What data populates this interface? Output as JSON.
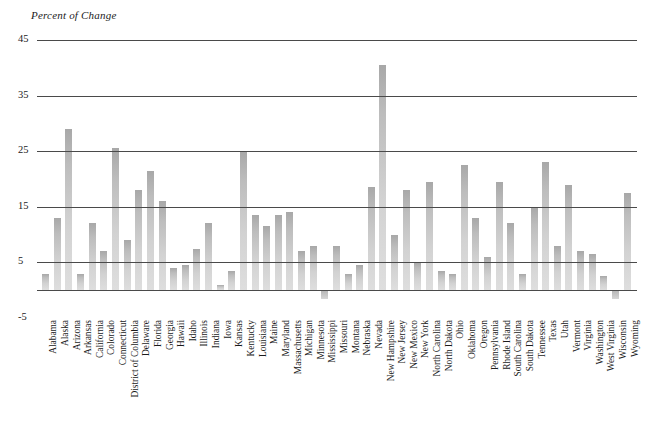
{
  "chart_data": {
    "type": "bar",
    "title": "Percent of Change",
    "xlabel": "",
    "ylabel": "Percent of Change",
    "ylim": [
      -5,
      45
    ],
    "yticks": [
      45,
      35,
      25,
      15,
      5,
      -5
    ],
    "grid": true,
    "zero_line": true,
    "legend": "none",
    "bar_color": "#c4c4c4",
    "axis_color": "#4a4a4a",
    "categories": [
      "Alabama",
      "Alaska",
      "Arizona",
      "Arkansas",
      "California",
      "Colorado",
      "Connecticut",
      "District of Columbia",
      "Delaware",
      "Florida",
      "Georgia",
      "Hawaii",
      "Idaho",
      "Illinois",
      "Indiana",
      "Iowa",
      "Kansas",
      "Kentucky",
      "Louisiana",
      "Maine",
      "Maryland",
      "Massachusetts",
      "Michigan",
      "Minnesota",
      "Mississippi",
      "Missouri",
      "Montana",
      "Nebraska",
      "Nevada",
      "New Hampshire",
      "New Jersey",
      "New Mexico",
      "New York",
      "North Carolina",
      "North Dakota",
      "Ohio",
      "Oklahoma",
      "Oregon",
      "Pennsylvania",
      "Rhode Island",
      "South Carolina",
      "South Dakota",
      "Tennessee",
      "Texas",
      "Utah",
      "Vermont",
      "Virginia",
      "Washington",
      "West Virginia",
      "Wisconsin",
      "Wyoming"
    ],
    "values": [
      3.0,
      13.0,
      29.0,
      3.0,
      12.0,
      7.0,
      25.5,
      9.0,
      18.0,
      21.5,
      16.0,
      4.0,
      4.5,
      7.5,
      12.0,
      1.0,
      3.5,
      25.0,
      13.5,
      11.5,
      13.5,
      14.0,
      7.0,
      8.0,
      -1.5,
      8.0,
      3.0,
      4.5,
      18.5,
      40.5,
      10.0,
      18.0,
      5.0,
      19.5,
      3.5,
      3.0,
      22.5,
      13.0,
      6.0,
      19.5,
      12.0,
      3.0,
      15.0,
      23.0,
      8.0,
      19.0,
      7.0,
      6.5,
      2.5,
      -1.5,
      17.5
    ]
  }
}
